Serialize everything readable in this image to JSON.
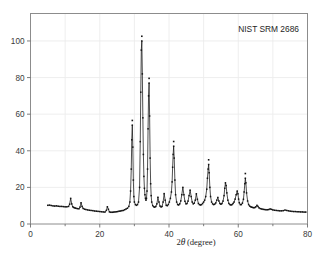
{
  "figure": {
    "annotation": "NIST SRM 2686",
    "background_color": "#ffffff",
    "frame_color": "#8c8c8c",
    "grid_color": "#ececec",
    "curve_color": "#141414"
  },
  "chart_data": {
    "type": "line",
    "title": "",
    "subtitle": "",
    "annotations": [
      "NIST SRM 2686"
    ],
    "xlabel": "2θ (degree)",
    "xlabel_parts": {
      "symbol": "2",
      "italic": "θ",
      "unit": "(degree)"
    },
    "ylabel": "",
    "xlim": [
      0,
      80
    ],
    "ylim": [
      0,
      115
    ],
    "xticks": [
      0,
      20,
      40,
      60,
      80
    ],
    "xticklabels": [
      "0",
      "20",
      "40",
      "60",
      "80"
    ],
    "xminorticks": [
      10,
      30,
      50,
      70
    ],
    "yticks": [
      0,
      20,
      40,
      60,
      80,
      100
    ],
    "yticklabels": [
      "0",
      "20",
      "40",
      "60",
      "80",
      "100"
    ],
    "grid": true,
    "grid_x": [
      10,
      20,
      30,
      40,
      50,
      60,
      70
    ],
    "grid_y": [
      20,
      40,
      60,
      80,
      100
    ],
    "legend": null,
    "legend_position": null,
    "series": [
      {
        "name": "NIST SRM 2686 diffraction pattern",
        "marker": "cross",
        "line": "solid",
        "x": [
          5.0,
          5.5,
          6.0,
          6.5,
          7.0,
          7.5,
          8.0,
          8.5,
          9.0,
          9.5,
          10.0,
          10.5,
          11.0,
          11.3,
          11.6,
          11.9,
          12.2,
          12.5,
          12.8,
          13.1,
          13.5,
          14.0,
          14.3,
          14.6,
          14.9,
          15.2,
          15.6,
          16.0,
          16.5,
          17.0,
          17.5,
          18.0,
          18.5,
          19.0,
          19.5,
          20.0,
          20.5,
          21.0,
          21.5,
          21.9,
          22.2,
          22.5,
          22.8,
          23.2,
          23.6,
          24.0,
          24.4,
          24.8,
          25.2,
          25.6,
          26.0,
          26.4,
          26.8,
          27.2,
          27.6,
          28.0,
          28.4,
          28.7,
          28.9,
          29.1,
          29.25,
          29.4,
          29.55,
          29.7,
          29.85,
          30.0,
          30.3,
          30.6,
          30.9,
          31.2,
          31.5,
          31.7,
          31.85,
          32.0,
          32.15,
          32.3,
          32.45,
          32.6,
          32.75,
          32.9,
          33.05,
          33.2,
          33.35,
          33.5,
          33.65,
          33.8,
          33.95,
          34.1,
          34.25,
          34.4,
          34.55,
          34.7,
          34.85,
          35.0,
          35.3,
          35.6,
          35.9,
          36.2,
          36.5,
          36.8,
          37.1,
          37.4,
          37.7,
          38.0,
          38.3,
          38.6,
          38.9,
          39.2,
          39.5,
          39.8,
          40.1,
          40.4,
          40.7,
          40.9,
          41.05,
          41.2,
          41.35,
          41.5,
          41.7,
          41.9,
          42.2,
          42.5,
          42.8,
          43.1,
          43.4,
          43.7,
          44.0,
          44.3,
          44.6,
          44.9,
          45.2,
          45.5,
          45.8,
          46.1,
          46.4,
          46.7,
          47.0,
          47.3,
          47.6,
          47.9,
          48.2,
          48.5,
          48.8,
          49.1,
          49.4,
          49.7,
          50.0,
          50.3,
          50.6,
          50.9,
          51.1,
          51.3,
          51.45,
          51.6,
          51.8,
          52.0,
          52.3,
          52.6,
          52.9,
          53.2,
          53.5,
          53.8,
          54.1,
          54.4,
          54.7,
          55.0,
          55.3,
          55.6,
          55.9,
          56.1,
          56.3,
          56.5,
          56.7,
          57.0,
          57.3,
          57.6,
          57.9,
          58.2,
          58.5,
          58.8,
          59.1,
          59.4,
          59.7,
          59.9,
          60.1,
          60.3,
          60.6,
          60.9,
          61.2,
          61.5,
          61.7,
          61.9,
          62.05,
          62.2,
          62.4,
          62.7,
          63.0,
          63.3,
          63.6,
          63.9,
          64.2,
          64.5,
          64.8,
          65.1,
          65.4,
          65.7,
          66.0,
          66.4,
          66.8,
          67.2,
          67.6,
          68.0,
          68.4,
          68.8,
          69.2,
          69.6,
          70.0,
          70.5,
          71.0,
          71.5,
          72.0,
          72.5,
          73.0,
          73.5,
          74.0,
          74.5,
          75.0,
          75.5,
          76.0,
          76.5,
          77.0,
          77.5,
          78.0,
          78.5,
          79.0,
          79.5
        ],
        "y": [
          10.2,
          10.3,
          10.1,
          9.9,
          9.8,
          9.9,
          9.7,
          9.6,
          9.6,
          9.5,
          9.4,
          9.4,
          9.6,
          10.8,
          14.0,
          11.0,
          9.4,
          9.0,
          8.8,
          8.6,
          8.4,
          8.3,
          9.2,
          11.6,
          9.6,
          8.5,
          8.1,
          7.9,
          7.7,
          7.5,
          7.4,
          7.3,
          7.1,
          7.0,
          6.9,
          6.8,
          6.7,
          6.6,
          6.5,
          7.4,
          9.4,
          8.0,
          6.6,
          6.4,
          6.4,
          6.5,
          6.6,
          6.7,
          6.8,
          7.0,
          7.1,
          7.3,
          7.4,
          7.8,
          8.2,
          8.6,
          9.6,
          12.0,
          18.0,
          30.0,
          46.0,
          54.0,
          42.0,
          24.0,
          15.0,
          12.0,
          10.6,
          10.2,
          10.6,
          12.0,
          20.0,
          45.0,
          72.0,
          95.0,
          100.0,
          82.0,
          58.0,
          38.0,
          26.0,
          19.5,
          16.0,
          14.0,
          13.0,
          14.0,
          18.0,
          30.0,
          52.0,
          70.0,
          77.0,
          59.0,
          36.0,
          22.0,
          15.5,
          12.0,
          10.0,
          9.4,
          9.2,
          9.6,
          11.0,
          14.6,
          12.0,
          9.8,
          9.3,
          9.6,
          12.0,
          16.6,
          13.0,
          10.2,
          10.0,
          10.6,
          12.0,
          14.0,
          17.5,
          23.0,
          31.0,
          38.0,
          42.5,
          36.0,
          24.0,
          16.0,
          12.0,
          10.6,
          10.4,
          11.0,
          12.6,
          16.0,
          20.0,
          16.0,
          12.4,
          11.0,
          11.2,
          12.5,
          15.5,
          18.5,
          15.0,
          12.0,
          11.0,
          11.4,
          13.0,
          16.5,
          13.5,
          11.2,
          10.6,
          10.4,
          10.6,
          11.2,
          12.0,
          13.0,
          15.0,
          19.0,
          25.0,
          30.0,
          32.5,
          28.0,
          20.0,
          15.0,
          12.0,
          11.0,
          10.6,
          10.8,
          11.5,
          13.0,
          14.5,
          12.6,
          11.2,
          10.8,
          11.2,
          12.5,
          15.5,
          19.5,
          22.5,
          21.0,
          17.0,
          13.0,
          11.2,
          10.6,
          10.4,
          10.6,
          11.2,
          12.0,
          13.6,
          16.0,
          18.0,
          16.5,
          13.6,
          11.6,
          10.6,
          10.6,
          11.4,
          13.5,
          17.5,
          22.0,
          25.0,
          22.5,
          17.0,
          12.6,
          10.6,
          9.8,
          9.4,
          9.2,
          9.0,
          8.9,
          9.0,
          9.4,
          10.2,
          9.6,
          8.8,
          8.4,
          8.2,
          8.0,
          7.9,
          7.8,
          7.8,
          7.9,
          8.2,
          8.0,
          7.7,
          7.5,
          7.4,
          7.3,
          7.2,
          7.2,
          7.3,
          7.6,
          7.4,
          7.2,
          7.0,
          6.9,
          6.8,
          6.8,
          6.7,
          6.7,
          6.6,
          6.6,
          6.5,
          6.5
        ]
      }
    ],
    "peaks": [
      {
        "two_theta": 29.4,
        "intensity": 54
      },
      {
        "two_theta": 32.15,
        "intensity": 100
      },
      {
        "two_theta": 34.25,
        "intensity": 77
      },
      {
        "two_theta": 41.35,
        "intensity": 42.5
      },
      {
        "two_theta": 51.45,
        "intensity": 32.5
      },
      {
        "two_theta": 62.05,
        "intensity": 25
      }
    ]
  }
}
